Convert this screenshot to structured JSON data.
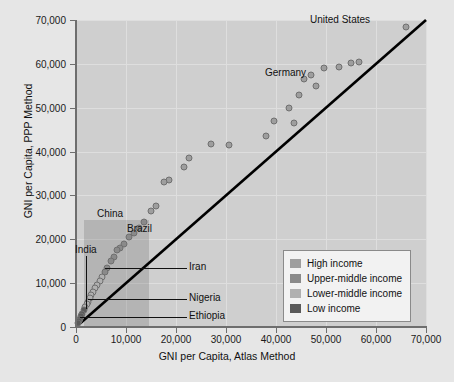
{
  "chart_data": {
    "type": "scatter",
    "title": "",
    "xlabel": "GNI per Capita, Atlas Method",
    "ylabel": "GNI per Capita, PPP Method",
    "xlim": [
      0,
      70000
    ],
    "ylim": [
      0,
      70000
    ],
    "xticks": [
      0,
      10000,
      20000,
      30000,
      40000,
      50000,
      60000,
      70000
    ],
    "yticks": [
      0,
      10000,
      20000,
      30000,
      40000,
      50000,
      60000,
      70000
    ],
    "xtick_labels": [
      "0",
      "10,000",
      "20,000",
      "30,000",
      "40,000",
      "50,000",
      "60,000",
      "70,000"
    ],
    "ytick_labels": [
      "0",
      "10,000",
      "20,000",
      "30,000",
      "40,000",
      "50,000",
      "60,000",
      "70,000"
    ],
    "grid": true,
    "legend_position": "lower-right",
    "reference_line": {
      "name": "parity-line",
      "from": [
        0,
        0
      ],
      "to": [
        70000,
        70000
      ]
    },
    "highlight_region": {
      "x0": 1500,
      "x1": 14500,
      "y0": 0,
      "y1": 24500
    },
    "legend": [
      {
        "label": "High income",
        "color": "#9e9e9e"
      },
      {
        "label": "Upper-middle income",
        "color": "#8a8a8a"
      },
      {
        "label": "Lower-middle income",
        "color": "#b0b0b0"
      },
      {
        "label": "Low income",
        "color": "#5a5a5a"
      }
    ],
    "series": [
      {
        "name": "countries",
        "points": [
          {
            "x": 66000,
            "y": 68500,
            "group": "High income",
            "label": "United States"
          },
          {
            "x": 56500,
            "y": 60500,
            "group": "High income"
          },
          {
            "x": 55000,
            "y": 60200,
            "group": "High income"
          },
          {
            "x": 52500,
            "y": 59300,
            "group": "High income"
          },
          {
            "x": 49500,
            "y": 59000,
            "group": "High income"
          },
          {
            "x": 47000,
            "y": 57500,
            "group": "High income"
          },
          {
            "x": 45500,
            "y": 56500,
            "group": "High income"
          },
          {
            "x": 48000,
            "y": 55000,
            "group": "High income",
            "label": "Germany"
          },
          {
            "x": 44500,
            "y": 53000,
            "group": "High income"
          },
          {
            "x": 42500,
            "y": 50000,
            "group": "High income"
          },
          {
            "x": 43500,
            "y": 46500,
            "group": "High income"
          },
          {
            "x": 39500,
            "y": 47000,
            "group": "High income"
          },
          {
            "x": 38000,
            "y": 43500,
            "group": "High income"
          },
          {
            "x": 30500,
            "y": 41500,
            "group": "High income"
          },
          {
            "x": 27000,
            "y": 41800,
            "group": "High income"
          },
          {
            "x": 22500,
            "y": 38500,
            "group": "High income"
          },
          {
            "x": 21500,
            "y": 36500,
            "group": "High income"
          },
          {
            "x": 18500,
            "y": 33500,
            "group": "High income"
          },
          {
            "x": 17500,
            "y": 33000,
            "group": "High income"
          },
          {
            "x": 16000,
            "y": 27500,
            "group": "High income"
          },
          {
            "x": 15000,
            "y": 26500,
            "group": "High income"
          },
          {
            "x": 13500,
            "y": 24000,
            "group": "Upper-middle income"
          },
          {
            "x": 12500,
            "y": 22500,
            "group": "Upper-middle income"
          },
          {
            "x": 11500,
            "y": 21500,
            "group": "Upper-middle income"
          },
          {
            "x": 10500,
            "y": 20500,
            "group": "Upper-middle income"
          },
          {
            "x": 9500,
            "y": 19000,
            "group": "Upper-middle income",
            "label": "Brazil"
          },
          {
            "x": 8800,
            "y": 18000,
            "group": "Upper-middle income"
          },
          {
            "x": 8200,
            "y": 17500,
            "group": "Upper-middle income",
            "label": "China"
          },
          {
            "x": 7500,
            "y": 16000,
            "group": "Upper-middle income"
          },
          {
            "x": 7000,
            "y": 15000,
            "group": "Upper-middle income"
          },
          {
            "x": 6200,
            "y": 13500,
            "group": "Upper-middle income",
            "label": "Iran"
          },
          {
            "x": 5800,
            "y": 12500,
            "group": "Upper-middle income"
          },
          {
            "x": 5200,
            "y": 11500,
            "group": "Lower-middle income"
          },
          {
            "x": 4700,
            "y": 10500,
            "group": "Lower-middle income"
          },
          {
            "x": 4200,
            "y": 9500,
            "group": "Lower-middle income"
          },
          {
            "x": 3800,
            "y": 8800,
            "group": "Lower-middle income"
          },
          {
            "x": 3400,
            "y": 8000,
            "group": "Lower-middle income"
          },
          {
            "x": 3000,
            "y": 7200,
            "group": "Lower-middle income"
          },
          {
            "x": 2700,
            "y": 6500,
            "group": "Lower-middle income"
          },
          {
            "x": 2400,
            "y": 5800,
            "group": "Lower-middle income",
            "label": "Nigeria"
          },
          {
            "x": 2100,
            "y": 5200,
            "group": "Lower-middle income",
            "label": "India"
          },
          {
            "x": 1800,
            "y": 4500,
            "group": "Lower-middle income"
          },
          {
            "x": 1500,
            "y": 3800,
            "group": "Low income"
          },
          {
            "x": 1200,
            "y": 3000,
            "group": "Low income"
          },
          {
            "x": 900,
            "y": 2400,
            "group": "Low income"
          },
          {
            "x": 700,
            "y": 1800,
            "group": "Low income",
            "label": "Ethiopia"
          },
          {
            "x": 500,
            "y": 1300,
            "group": "Low income"
          },
          {
            "x": 350,
            "y": 900,
            "group": "Low income"
          }
        ]
      }
    ],
    "annotations": [
      {
        "text": "United States",
        "anchor": "left-of-point"
      },
      {
        "text": "Germany",
        "anchor": "left-of-point"
      },
      {
        "text": "China",
        "anchor": "above-point"
      },
      {
        "text": "Brazil",
        "anchor": "right-of-point"
      },
      {
        "text": "India",
        "anchor": "leader-line"
      },
      {
        "text": "Iran",
        "anchor": "leader-line"
      },
      {
        "text": "Nigeria",
        "anchor": "leader-line"
      },
      {
        "text": "Ethiopia",
        "anchor": "leader-line"
      }
    ]
  },
  "colors": {
    "figure_background": "#e6e6e6",
    "plot_background": "#cfcfcf",
    "gridline": "#dedede",
    "axis": "#6e6e6e",
    "parity_line": "#000000",
    "highlight": "rgba(120,120,120,0.30)",
    "text": "#111111",
    "legend_background": "#f2f2f2",
    "legend_border": "#8a8a8a",
    "point_fill": "#8f8f8f",
    "point_stroke": "#6f6f6f"
  }
}
